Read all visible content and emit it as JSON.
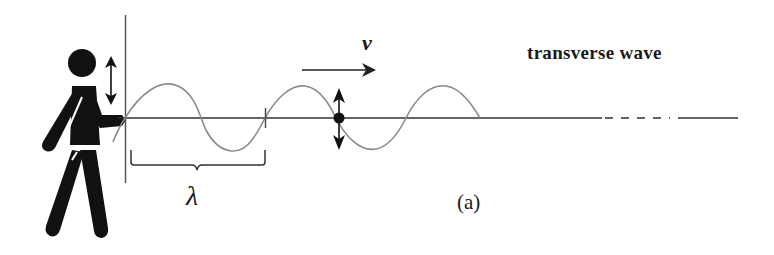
{
  "diagram": {
    "title": "transverse wave",
    "velocity_label": "v",
    "wavelength_label": "λ",
    "panel_label": "(a)",
    "elements": [
      "person-figure",
      "hand-motion-arrow (up/down)",
      "vertical reference line",
      "equilibrium axis line (solid, then dashed, then solid)",
      "sine wave (gray), about 2.5 wavelengths",
      "velocity arrow pointing right",
      "particle dot with up/down arrows",
      "wavelength brace"
    ],
    "colors": {
      "ink": "#111111",
      "wave": "#8a8a8a",
      "axis": "#333333"
    }
  }
}
